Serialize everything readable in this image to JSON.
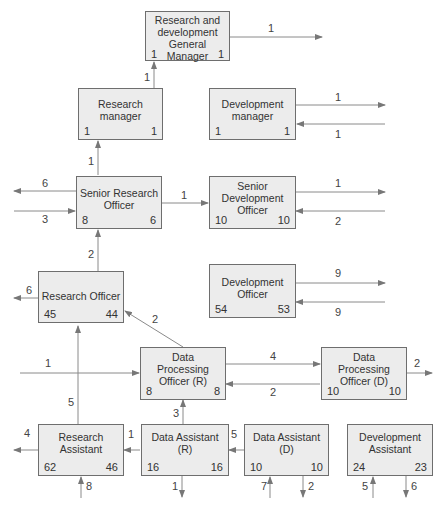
{
  "diagram": {
    "boxes": {
      "gm": {
        "title": "Research and development General Manager",
        "left": "1",
        "right": "1"
      },
      "rm": {
        "title": "Research manager",
        "left": "1",
        "right": "1"
      },
      "dm": {
        "title": "Development manager",
        "left": "1",
        "right": "1"
      },
      "sro": {
        "title": "Senior Research Officer",
        "left": "8",
        "right": "6"
      },
      "sdo": {
        "title": "Senior Development Officer",
        "left": "10",
        "right": "10"
      },
      "ro": {
        "title": "Research Officer",
        "left": "45",
        "right": "44"
      },
      "do": {
        "title": "Development Officer",
        "left": "54",
        "right": "53"
      },
      "dpr": {
        "title": "Data Processing Officer (R)",
        "left": "8",
        "right": "8"
      },
      "dpd": {
        "title": "Data Processing Officer (D)",
        "left": "10",
        "right": "10"
      },
      "ra": {
        "title": "Research Assistant",
        "left": "62",
        "right": "46"
      },
      "dar": {
        "title": "Data Assistant (R)",
        "left": "16",
        "right": "16"
      },
      "dad": {
        "title": "Data Assistant (D)",
        "left": "10",
        "right": "10"
      },
      "da": {
        "title": "Development Assistant",
        "left": "24",
        "right": "23"
      }
    },
    "flows": {
      "gm_out": "1",
      "rm_to_gm": "1",
      "dm_out": "1",
      "dm_in": "1",
      "sro_to_rm": "1",
      "sro_out": "6",
      "sro_in": "3",
      "sro_to_sdo": "1",
      "sdo_out": "1",
      "sdo_in": "2",
      "ro_to_sro": "2",
      "ro_out": "6",
      "do_out": "9",
      "do_in": "9",
      "dpr_to_ro": "2",
      "dpr_in": "1",
      "dpr_to_dpd": "4",
      "dpd_to_dpr": "2",
      "dpd_out": "2",
      "ra_to_ro": "5",
      "ra_out": "4",
      "ra_in": "8",
      "dar_to_ra": "1",
      "dar_to_dpr": "3",
      "dar_out": "1",
      "dad_to_dar": "5",
      "dad_in": "7",
      "dad_out": "2",
      "da_in": "5",
      "da_out": "6"
    },
    "colors": {
      "box_fill": "#ececec",
      "box_border": "#6e6e6e",
      "line": "#8a8a8a"
    }
  }
}
